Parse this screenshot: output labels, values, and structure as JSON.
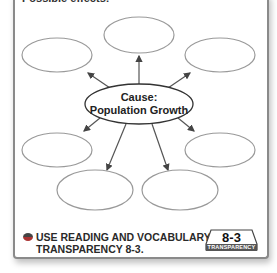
{
  "header": {
    "cutoff_text": "Possible effects:"
  },
  "diagram": {
    "type": "cause-effect web",
    "center": {
      "line1": "Cause:",
      "line2": "Population Growth"
    },
    "effect_bubbles": [
      {
        "id": "top",
        "text": ""
      },
      {
        "id": "top-left",
        "text": ""
      },
      {
        "id": "top-right",
        "text": ""
      },
      {
        "id": "bottom-left",
        "text": ""
      },
      {
        "id": "bottom-right",
        "text": ""
      },
      {
        "id": "lower-left",
        "text": ""
      },
      {
        "id": "lower-right",
        "text": ""
      }
    ],
    "colors": {
      "bubble_stroke": "#9a9a9a",
      "center_stroke": "#333333",
      "arrow": "#444444"
    }
  },
  "footer": {
    "instruction_line1": "USE READING AND VOCABULARY",
    "instruction_line2": "TRANSPARENCY 8-3.",
    "badge_number": "8-3",
    "badge_label": "TRANSPARENCY"
  }
}
